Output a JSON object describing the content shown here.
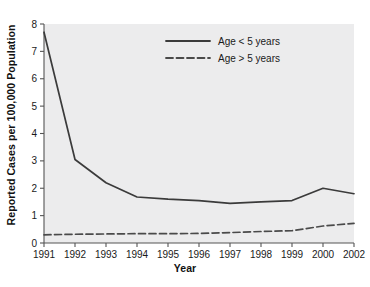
{
  "chart_data": {
    "type": "line",
    "title": "",
    "xlabel": "Year",
    "ylabel": "Reported Cases per 100,000 Population",
    "categories": [
      "1991",
      "1992",
      "1993",
      "1994",
      "1995",
      "1996",
      "1997",
      "1998",
      "1999",
      "2000",
      "2002"
    ],
    "x_tick_labels": [
      "1991",
      "1992",
      "1993",
      "1994",
      "1995",
      "1996",
      "1997",
      "1998",
      "1999",
      "2000",
      "2002"
    ],
    "y_tick_labels": [
      "0",
      "1",
      "2",
      "3",
      "4",
      "5",
      "6",
      "7",
      "8"
    ],
    "ylim": [
      0,
      8
    ],
    "y_ticks": [
      0,
      1,
      2,
      3,
      4,
      5,
      6,
      7,
      8
    ],
    "grid": false,
    "legend_position": "top-center",
    "series": [
      {
        "name": "Age < 5 years",
        "style": "solid",
        "color": "#3b3b3b",
        "values": [
          7.7,
          3.05,
          2.2,
          1.68,
          1.6,
          1.55,
          1.45,
          1.5,
          1.55,
          2.0,
          1.8
        ]
      },
      {
        "name": "Age > 5 years",
        "style": "dashed",
        "color": "#4a4a4a",
        "values": [
          0.3,
          0.32,
          0.33,
          0.34,
          0.34,
          0.35,
          0.38,
          0.42,
          0.45,
          0.62,
          0.72
        ]
      }
    ]
  },
  "legend": {
    "items": [
      {
        "label": "Age < 5 years",
        "style": "solid"
      },
      {
        "label": "Age > 5 years",
        "style": "dashed"
      }
    ]
  },
  "style": {
    "plot_background": "#ececed",
    "axis_color": "#555555",
    "line_color": "#3b3b3b",
    "text_color": "#1a1a1a",
    "figure_background": "#ffffff"
  }
}
